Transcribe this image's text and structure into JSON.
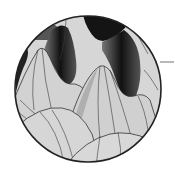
{
  "figure": {
    "colors": {
      "background": "#ffffff",
      "surface": "#d4d4d4",
      "shadow": "#1a1a1a",
      "outline": "#2a2a2a",
      "pointer": "#8a8a8a"
    },
    "circle": {
      "cx": 88,
      "cy": 89,
      "r": 73
    },
    "pointer_line": {
      "x1": 160,
      "y1": 62,
      "x2": 174,
      "y2": 62
    }
  }
}
